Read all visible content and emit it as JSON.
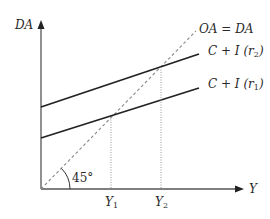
{
  "diagram": {
    "colors": {
      "axis": "#555555",
      "line": "#222222",
      "dashed": "#888888",
      "guide": "#999999",
      "text": "#2a2a2a"
    },
    "axes": {
      "y_label": "DA",
      "x_label": "Y"
    },
    "lines": [
      {
        "name": "oa-da",
        "label_main": "OA = DA",
        "style": "dashed"
      },
      {
        "name": "c-i-r2",
        "label_main": "C + I (r",
        "label_sub": "2",
        "label_end": ")",
        "style": "solid"
      },
      {
        "name": "c-i-r1",
        "label_main": "C + I (r",
        "label_sub": "1",
        "label_end": ")",
        "style": "solid"
      }
    ],
    "angle_label": "45°",
    "x_ticks": [
      {
        "main": "Y",
        "sub": "1"
      },
      {
        "main": "Y",
        "sub": "2"
      }
    ]
  }
}
